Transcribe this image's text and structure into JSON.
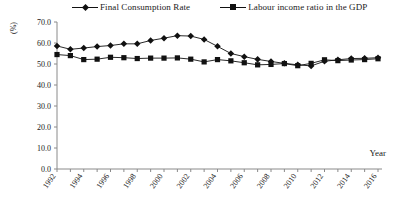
{
  "chart_data": {
    "type": "line",
    "title": "",
    "xlabel": "Year",
    "ylabel": "(%)",
    "ylim": [
      0.0,
      70.0
    ],
    "yticks": [
      "0.0",
      "10.0",
      "20.0",
      "30.0",
      "40.0",
      "50.0",
      "60.0",
      "70.0"
    ],
    "grid": false,
    "legend_position": "top",
    "categories": [
      "1992",
      "1993",
      "1994",
      "1995",
      "1996",
      "1997",
      "1998",
      "1999",
      "2000",
      "2001",
      "2002",
      "2003",
      "2004",
      "2005",
      "2006",
      "2007",
      "2008",
      "2009",
      "2010",
      "2011",
      "2012",
      "2013",
      "2014",
      "2015",
      "2016"
    ],
    "xtick_labels": [
      "1992",
      "1994",
      "1996",
      "1998",
      "2000",
      "2002",
      "2004",
      "2006",
      "2008",
      "2010",
      "2012",
      "2014",
      "2016"
    ],
    "series": [
      {
        "name": "Final Consumption Rate",
        "marker": "diamond",
        "color": "#111111",
        "values": [
          58.6,
          57.0,
          57.6,
          58.3,
          58.8,
          59.6,
          59.6,
          61.2,
          62.3,
          63.5,
          63.3,
          61.7,
          58.4,
          55.0,
          53.5,
          52.2,
          51.2,
          50.3,
          49.6,
          49.1,
          51.3,
          52.0,
          52.6,
          52.7,
          53.0
        ]
      },
      {
        "name": "Labour income ratio in the GDP",
        "marker": "square",
        "color": "#111111",
        "values": [
          54.5,
          54.0,
          52.1,
          52.3,
          53.2,
          53.0,
          52.6,
          52.8,
          52.8,
          52.9,
          52.3,
          51.0,
          52.1,
          51.5,
          50.6,
          49.6,
          49.8,
          50.2,
          49.2,
          50.3,
          52.0,
          51.6,
          51.9,
          52.1,
          52.5
        ]
      }
    ]
  },
  "legend": {
    "entries": [
      {
        "label": "Final Consumption Rate"
      },
      {
        "label": "Labour income ratio in the GDP"
      }
    ]
  },
  "axes": {
    "y_axis_title": "(%)",
    "x_axis_title": "Year"
  }
}
